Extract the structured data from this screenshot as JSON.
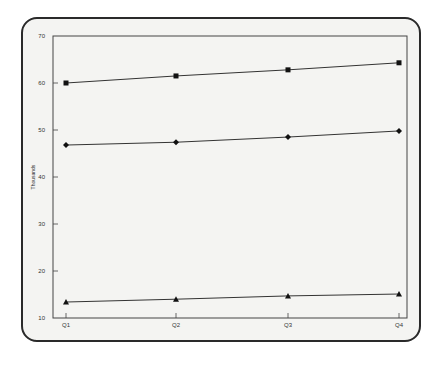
{
  "chart_data": {
    "type": "line",
    "title": "",
    "xlabel": "",
    "ylabel": "Thousands",
    "categories": [
      "Q1",
      "Q2",
      "Q3",
      "Q4"
    ],
    "ylim": [
      10,
      70
    ],
    "yticks": [
      10,
      20,
      30,
      40,
      50,
      60,
      70
    ],
    "grid": false,
    "legend": null,
    "series": [
      {
        "name": "Series 1 (square)",
        "marker": "square",
        "values": [
          60.0,
          61.5,
          62.8,
          64.3
        ]
      },
      {
        "name": "Series 2 (diamond)",
        "marker": "diamond",
        "values": [
          46.8,
          47.4,
          48.5,
          49.8
        ]
      },
      {
        "name": "Series 3 (triangle)",
        "marker": "triangle",
        "values": [
          13.4,
          14.0,
          14.7,
          15.1
        ]
      }
    ]
  },
  "colors": {
    "line": "#333333",
    "marker": "#111111",
    "frame_bg": "#f4f4f2",
    "frame_border": "#2a2a2a"
  }
}
